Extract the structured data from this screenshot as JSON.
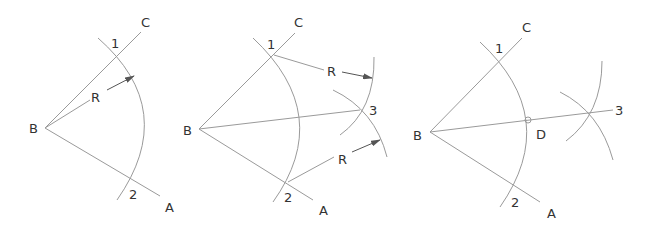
{
  "colors": {
    "background": "#ffffff",
    "line": "#9a9a9a",
    "text": "#333333",
    "arrow": "#555555"
  },
  "diagrams": [
    {
      "id": "step-1",
      "labels": {
        "B": "B",
        "C": "C",
        "A": "A",
        "p1": "1",
        "p2": "2",
        "R": "R"
      }
    },
    {
      "id": "step-2",
      "labels": {
        "B": "B",
        "C": "C",
        "A": "A",
        "p1": "1",
        "p2": "2",
        "p3": "3",
        "R1": "R",
        "R2": "R"
      }
    },
    {
      "id": "step-3",
      "labels": {
        "B": "B",
        "C": "C",
        "A": "A",
        "p1": "1",
        "p2": "2",
        "p3": "3",
        "D": "D"
      }
    }
  ]
}
